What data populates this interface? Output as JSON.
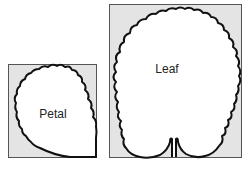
{
  "diagram": {
    "panels": [
      {
        "id": "petal",
        "label": "Petal",
        "box": {
          "x": 8,
          "y": 64,
          "w": 88,
          "h": 93
        }
      },
      {
        "id": "leaf",
        "label": "Leaf",
        "box": {
          "x": 109,
          "y": 4,
          "w": 132,
          "h": 153
        }
      }
    ],
    "colors": {
      "panel_fill": "#e4e4e4",
      "panel_border": "#555555",
      "shape_fill": "#ffffff",
      "shape_stroke": "#111111"
    }
  }
}
